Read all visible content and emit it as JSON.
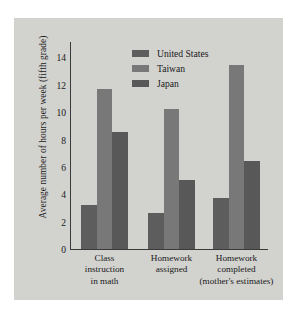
{
  "chart_data": {
    "type": "bar",
    "title": "",
    "subtitle": "",
    "xlabel": "",
    "ylabel": "Average number of hours per week (fifth grade)",
    "ylim": [
      0,
      15
    ],
    "yticks": [
      0,
      2,
      4,
      6,
      8,
      10,
      12,
      14
    ],
    "grid": false,
    "legend_position": "top-right",
    "categories": [
      "Class instruction in math",
      "Homework assigned",
      "Homework completed (mother's estimates)"
    ],
    "category_lines": [
      [
        "Class",
        "instruction",
        "in math"
      ],
      [
        "Homework",
        "assigned"
      ],
      [
        "Homework",
        "completed",
        "(mother's estimates)"
      ]
    ],
    "series": [
      {
        "name": "United States",
        "color": "#5d5d5d",
        "values": [
          3.2,
          2.6,
          3.7
        ]
      },
      {
        "name": "Taiwan",
        "color": "#787878",
        "values": [
          11.6,
          10.2,
          13.4
        ]
      },
      {
        "name": "Japan",
        "color": "#585858",
        "values": [
          8.5,
          5.0,
          6.4
        ]
      }
    ]
  },
  "figure": {
    "background_color": "#d2d2cf",
    "axis_color": "#3a3a3a",
    "text_color": "#1a1a1a"
  }
}
